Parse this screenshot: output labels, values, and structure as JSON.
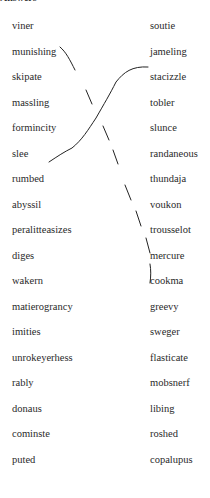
{
  "header": {
    "text": "Answers"
  },
  "left_words": [
    "viner",
    "munishing",
    "skipate",
    "massling",
    "formincity",
    "slee",
    "rumbed",
    "abyssil",
    "peralitteasizes",
    "diges",
    "wakern",
    "matierograncy",
    "imities",
    "unrokeyerhess",
    "rably",
    "donaus",
    "cominste",
    "puted"
  ],
  "right_words": [
    "soutie",
    "jameling",
    "stacizzle",
    "tobler",
    "slunce",
    "randaneous",
    "thundaja",
    "voukon",
    "trousselot",
    "mercure",
    "cookma",
    "greevy",
    "sweger",
    "flasticate",
    "mobsnerf",
    "libing",
    "roshed",
    "copalupus"
  ],
  "connections": [
    {
      "from": "munishing",
      "to": "cookma",
      "style": "dashed"
    },
    {
      "from": "rumbed",
      "to": "stacizzle",
      "style": "solid"
    }
  ]
}
